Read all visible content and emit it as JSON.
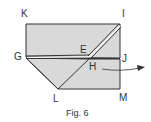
{
  "figure": {
    "caption": "Fig. 6",
    "fill_color": "#d9d9d9",
    "line_color": "#333333"
  },
  "labels": {
    "K": "K",
    "I": "I",
    "G": "G",
    "E": "E",
    "J": "J",
    "H": "H",
    "L": "L",
    "M": "M"
  }
}
